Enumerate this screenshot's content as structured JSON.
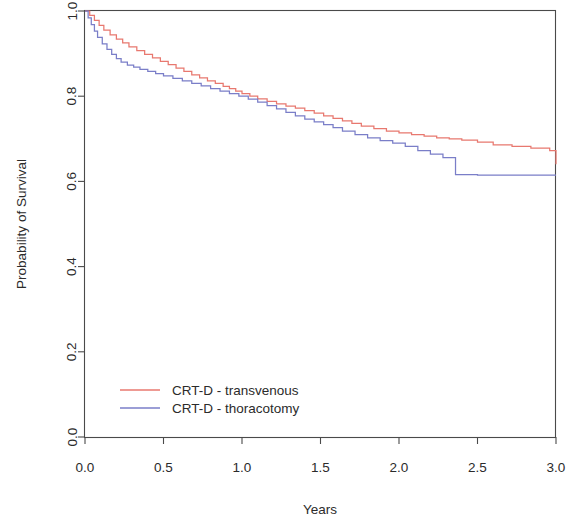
{
  "chart_data": {
    "type": "line",
    "title": "",
    "subtitle": "",
    "xlabel": "Years",
    "ylabel": "Probability of Survival",
    "xlim": [
      0.0,
      3.0
    ],
    "ylim": [
      0.0,
      1.0
    ],
    "xticks": [
      0.0,
      0.5,
      1.0,
      1.5,
      2.0,
      2.5,
      3.0
    ],
    "xticklabels": [
      "0.0",
      "0.5",
      "1.0",
      "1.5",
      "2.0",
      "2.5",
      "3.0"
    ],
    "yticks": [
      0.0,
      0.2,
      0.4,
      0.6,
      0.8,
      1.0
    ],
    "yticklabels": [
      "0.0",
      "0.2",
      "0.4",
      "0.6",
      "0.8",
      "1.0"
    ],
    "grid": false,
    "legend_position": "lower-left-inside",
    "curve_style": "step",
    "series": [
      {
        "name": "CRT-D - transvenous",
        "color": "#e8786f",
        "x": [
          0.0,
          0.03,
          0.06,
          0.09,
          0.12,
          0.16,
          0.2,
          0.24,
          0.28,
          0.33,
          0.38,
          0.43,
          0.48,
          0.53,
          0.58,
          0.63,
          0.68,
          0.73,
          0.78,
          0.83,
          0.88,
          0.92,
          0.96,
          1.0,
          1.05,
          1.1,
          1.16,
          1.22,
          1.28,
          1.34,
          1.4,
          1.46,
          1.52,
          1.58,
          1.64,
          1.7,
          1.76,
          1.84,
          1.92,
          2.0,
          2.08,
          2.16,
          2.24,
          2.32,
          2.4,
          2.5,
          2.6,
          2.72,
          2.84,
          2.96,
          3.0
        ],
        "y": [
          1.0,
          0.99,
          0.978,
          0.966,
          0.955,
          0.944,
          0.934,
          0.925,
          0.916,
          0.907,
          0.898,
          0.89,
          0.882,
          0.874,
          0.866,
          0.858,
          0.85,
          0.843,
          0.836,
          0.83,
          0.823,
          0.818,
          0.812,
          0.806,
          0.8,
          0.794,
          0.788,
          0.782,
          0.777,
          0.772,
          0.766,
          0.76,
          0.754,
          0.748,
          0.742,
          0.736,
          0.73,
          0.724,
          0.718,
          0.714,
          0.71,
          0.706,
          0.702,
          0.7,
          0.697,
          0.692,
          0.686,
          0.682,
          0.678,
          0.672,
          0.64
        ]
      },
      {
        "name": "CRT-D - thoracotomy",
        "color": "#7a7ec8",
        "x": [
          0.0,
          0.02,
          0.04,
          0.06,
          0.08,
          0.11,
          0.14,
          0.17,
          0.2,
          0.23,
          0.27,
          0.31,
          0.35,
          0.4,
          0.45,
          0.5,
          0.56,
          0.62,
          0.68,
          0.74,
          0.8,
          0.86,
          0.92,
          0.98,
          1.04,
          1.1,
          1.16,
          1.22,
          1.28,
          1.34,
          1.4,
          1.46,
          1.52,
          1.58,
          1.64,
          1.72,
          1.8,
          1.88,
          1.96,
          2.04,
          2.12,
          2.2,
          2.28,
          2.36,
          2.5,
          2.65,
          2.8,
          2.95,
          3.0
        ],
        "y": [
          1.0,
          0.984,
          0.968,
          0.953,
          0.938,
          0.923,
          0.91,
          0.898,
          0.888,
          0.88,
          0.873,
          0.868,
          0.863,
          0.858,
          0.853,
          0.848,
          0.842,
          0.836,
          0.83,
          0.824,
          0.818,
          0.812,
          0.806,
          0.8,
          0.793,
          0.786,
          0.778,
          0.77,
          0.762,
          0.754,
          0.746,
          0.74,
          0.733,
          0.726,
          0.718,
          0.71,
          0.702,
          0.696,
          0.69,
          0.682,
          0.672,
          0.664,
          0.656,
          0.616,
          0.615,
          0.615,
          0.615,
          0.615,
          0.615
        ]
      }
    ],
    "legend": [
      {
        "label": "CRT-D - transvenous",
        "color": "#e8786f"
      },
      {
        "label": "CRT-D - thoracotomy",
        "color": "#7a7ec8"
      }
    ]
  },
  "axes": {
    "y_title": "Probability of Survival",
    "x_title": "Years"
  }
}
